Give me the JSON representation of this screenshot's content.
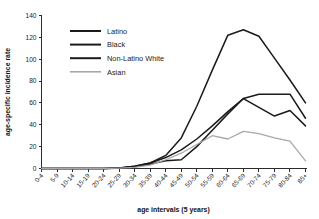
{
  "figure": {
    "cropped_header_text": "",
    "background": "#ffffff"
  },
  "axis": {
    "y_title": "age-specific incidence rate",
    "x_title": "age intervals (5 years)",
    "y_ticks": [
      "0",
      "20",
      "40",
      "60",
      "80",
      "100",
      "120",
      "140"
    ]
  },
  "legend": {
    "items": [
      {
        "label": "Latino",
        "color": "#1a1a1a"
      },
      {
        "label": "Black",
        "color": "#1a1a1a"
      },
      {
        "label": "Non-Latino White",
        "color": "#1a1a1a"
      },
      {
        "label": "Asian",
        "color": "#a8a8a8"
      }
    ]
  },
  "chart_data": {
    "type": "line",
    "title": "",
    "xlabel": "age intervals (5 years)",
    "ylabel": "age-specific incidence rate",
    "ylim": [
      0,
      140
    ],
    "ytick_step": 20,
    "grid": false,
    "legend_position": "upper-left",
    "categories": [
      "0-4",
      "5-9",
      "10-14",
      "15-19",
      "20-24",
      "25-29",
      "30-34",
      "35-39",
      "40-44",
      "45-49",
      "50-54",
      "55-59",
      "60-64",
      "65-69",
      "70-74",
      "75-79",
      "80-84",
      "85+"
    ],
    "series": [
      {
        "name": "Non-Latino White",
        "color": "#1a1a1a",
        "values": [
          0,
          0,
          0,
          0,
          0,
          0.5,
          2,
          5,
          12,
          28,
          57,
          90,
          122,
          127,
          121,
          101,
          81,
          60
        ]
      },
      {
        "name": "Latino",
        "color": "#1a1a1a",
        "values": [
          0,
          0,
          0,
          0,
          0,
          0.5,
          2,
          5,
          10,
          17,
          27,
          39,
          52,
          64,
          68,
          68,
          68,
          46
        ]
      },
      {
        "name": "Black",
        "color": "#1a1a1a",
        "values": [
          0,
          0,
          0,
          0,
          0,
          0.3,
          1.5,
          4,
          7,
          8,
          20,
          35,
          50,
          64,
          56,
          48,
          53,
          39
        ]
      },
      {
        "name": "Asian",
        "color": "#a8a8a8",
        "values": [
          0,
          0,
          0,
          0,
          0,
          0.3,
          1,
          3,
          8,
          14,
          22,
          30,
          27,
          34,
          32,
          28,
          25,
          7
        ]
      }
    ]
  }
}
